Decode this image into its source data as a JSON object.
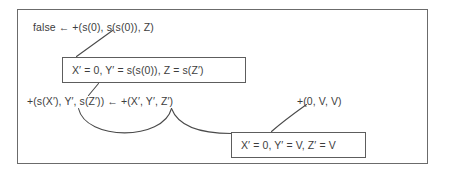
{
  "figure": {
    "name": "resolution-derivation-diagram",
    "background_color": "#ffffff",
    "frame_color": "#6b6b6b",
    "text_color": "#3d3d3d",
    "box_border_color": "#5d5d5d"
  },
  "clauses": {
    "goal": "false ← +(s(0), s(s(0)), Z)",
    "rule": "+(s(X′), Y′, s(Z′)) ← +(X′, Y′, Z′)",
    "fact": "+(0, V, V)"
  },
  "substitutions": {
    "upper": "X′ = 0, Y′ = s(s(0)), Z = s(Z′)",
    "lower": "X′ = 0, Y′ = V, Z′ = V"
  },
  "connectors": [
    {
      "name": "goal-to-upper-substitution",
      "kind": "line"
    },
    {
      "name": "upper-substitution-to-rule-head",
      "kind": "line"
    },
    {
      "name": "rule-head-to-rule-body",
      "kind": "arc"
    },
    {
      "name": "rule-body-to-lower-substitution",
      "kind": "arc"
    },
    {
      "name": "fact-to-lower-substitution",
      "kind": "arc"
    }
  ]
}
